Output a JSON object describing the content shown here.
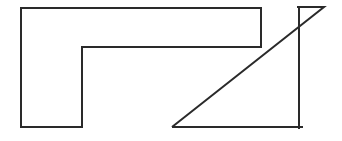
{
  "diagram": {
    "canvas": {
      "width": 342,
      "height": 141,
      "background": "#ffffff"
    },
    "stroke": {
      "color": "#2a2a2a",
      "width": 2
    },
    "shapes": [
      {
        "id": "l-shape",
        "type": "polygon",
        "points": [
          [
            21,
            8
          ],
          [
            261,
            8
          ],
          [
            261,
            47
          ],
          [
            82,
            47
          ],
          [
            82,
            127
          ],
          [
            21,
            127
          ]
        ]
      },
      {
        "id": "triangle",
        "type": "polyline",
        "points": [
          [
            172,
            127
          ],
          [
            324,
            7
          ],
          [
            297,
            7
          ]
        ]
      },
      {
        "id": "triangle-base",
        "type": "line",
        "points": [
          [
            172,
            127
          ],
          [
            303,
            127
          ]
        ]
      },
      {
        "id": "vertical-line",
        "type": "line",
        "points": [
          [
            299,
            7
          ],
          [
            299,
            129
          ]
        ]
      }
    ]
  }
}
